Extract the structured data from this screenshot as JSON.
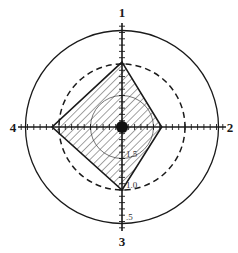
{
  "diagram": {
    "type": "polar-profile",
    "axes": [
      {
        "id": 1,
        "label": "1",
        "direction": "up",
        "value": 0.97
      },
      {
        "id": 2,
        "label": "2",
        "direction": "right",
        "value": 1.37
      },
      {
        "id": 3,
        "label": "3",
        "direction": "down",
        "value": 1.0
      },
      {
        "id": 4,
        "label": "4",
        "direction": "left",
        "value": 0.89
      }
    ],
    "scale": {
      "center_value": 2.0,
      "reference_rings": [
        {
          "value": 1.5,
          "label": "1.5",
          "style": "thin"
        },
        {
          "value": 1.0,
          "label": "1.0",
          "style": "dashed"
        },
        {
          "value": 0.5,
          "label": ".5",
          "style": "solid"
        }
      ],
      "tick_step": 0.1
    },
    "fill": "diagonal-hatch",
    "center_marker": "filled-dot",
    "colors": {
      "ink": "#1a1a1a",
      "background": "#ffffff"
    }
  }
}
